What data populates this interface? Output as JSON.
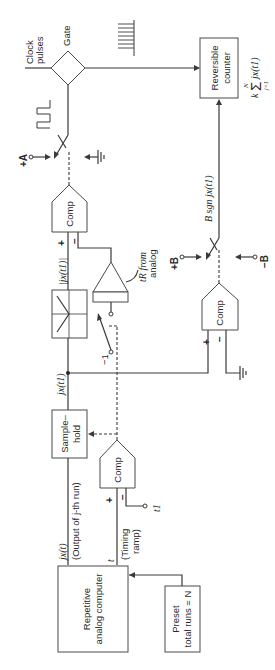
{
  "diagram": {
    "orientation": "rotated 90deg counter-clockwise",
    "blocks": {
      "repetitive_computer": {
        "line1": "Repetitive",
        "line2": "analog computer"
      },
      "preset": {
        "line1": "Preset",
        "line2": "total runs = N"
      },
      "sample_hold": {
        "line1": "Sample–",
        "line2": "hold"
      },
      "comp_timing": {
        "label": "Comp"
      },
      "comp_abs": {
        "label": "Comp"
      },
      "comp_sign": {
        "label": "Comp"
      },
      "abs_box": {
        "label": "|jx(t1)|"
      },
      "gate": {
        "label": "Gate"
      },
      "reversible_counter": {
        "line1": "Reversible",
        "line2": "counter"
      }
    },
    "labels": {
      "output_signal": "jx(t)",
      "output_desc": "(Output of j-th run)",
      "time_signal": "t",
      "timing_ramp_1": "(Timing",
      "timing_ramp_2": "ramp)",
      "t1": "t1",
      "node_sample": "jx(t1)",
      "abs_value": "|jx(t1)|",
      "tr_from_1": "tR from",
      "tr_from_2": "analog",
      "minus_one": "−1",
      "plus_a": "+A",
      "plus_b": "+B",
      "minus_b": "−B",
      "b_sgn": "B sgn jx(t1)",
      "clock_1": "Clock",
      "clock_2": "pulses",
      "sum_k": "k",
      "sum_sigma": "Σ",
      "sum_top": "N",
      "sum_bottom": "j=1",
      "sum_term": "jx(t1)",
      "plus": "+",
      "minus": "−"
    }
  }
}
